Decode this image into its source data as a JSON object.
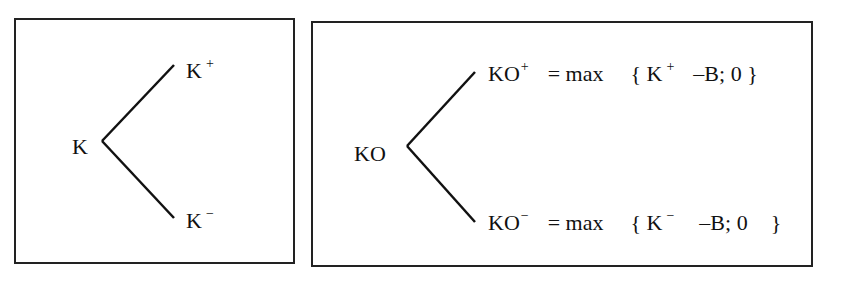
{
  "left_tree": {
    "root": "K",
    "up": {
      "base": "K",
      "sup": "+"
    },
    "down": {
      "base": "K",
      "sup": "−"
    }
  },
  "right_tree": {
    "root": "KO",
    "up": {
      "base": "KO",
      "sup": "+",
      "eq": "= max",
      "open": "{",
      "arg_base": "K",
      "arg_sup": "+",
      "rest": "–B; 0",
      "close": "}"
    },
    "down": {
      "base": "KO",
      "sup": "−",
      "eq": "= max",
      "open": "{",
      "arg_base": "K",
      "arg_sup": "−",
      "rest": "–B; 0",
      "close": "}"
    }
  }
}
